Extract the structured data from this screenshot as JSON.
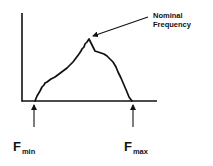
{
  "diagram": {
    "annotation": {
      "line1": "Nominal",
      "line2": "Frequency"
    },
    "markers": {
      "fmin": {
        "base": "F",
        "sub": "min"
      },
      "fmax": {
        "base": "F",
        "sub": "max"
      }
    },
    "colors": {
      "stroke": "#111111",
      "background": "#ffffff"
    }
  }
}
